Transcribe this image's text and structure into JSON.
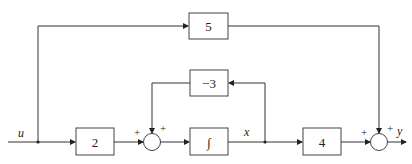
{
  "diagram": {
    "type": "block-diagram",
    "signals": {
      "input": "u",
      "state": "x",
      "output": "y"
    },
    "blocks": {
      "feedforward_gain": "5",
      "feedback_gain": "−3",
      "input_gain": "2",
      "integrator": "∫",
      "output_gain": "4"
    },
    "sum1": {
      "signs": [
        "+",
        "+"
      ]
    },
    "sum2": {
      "signs": [
        "+",
        "+"
      ]
    },
    "colors": {
      "line": "#333333",
      "background": "#ffffff"
    }
  }
}
